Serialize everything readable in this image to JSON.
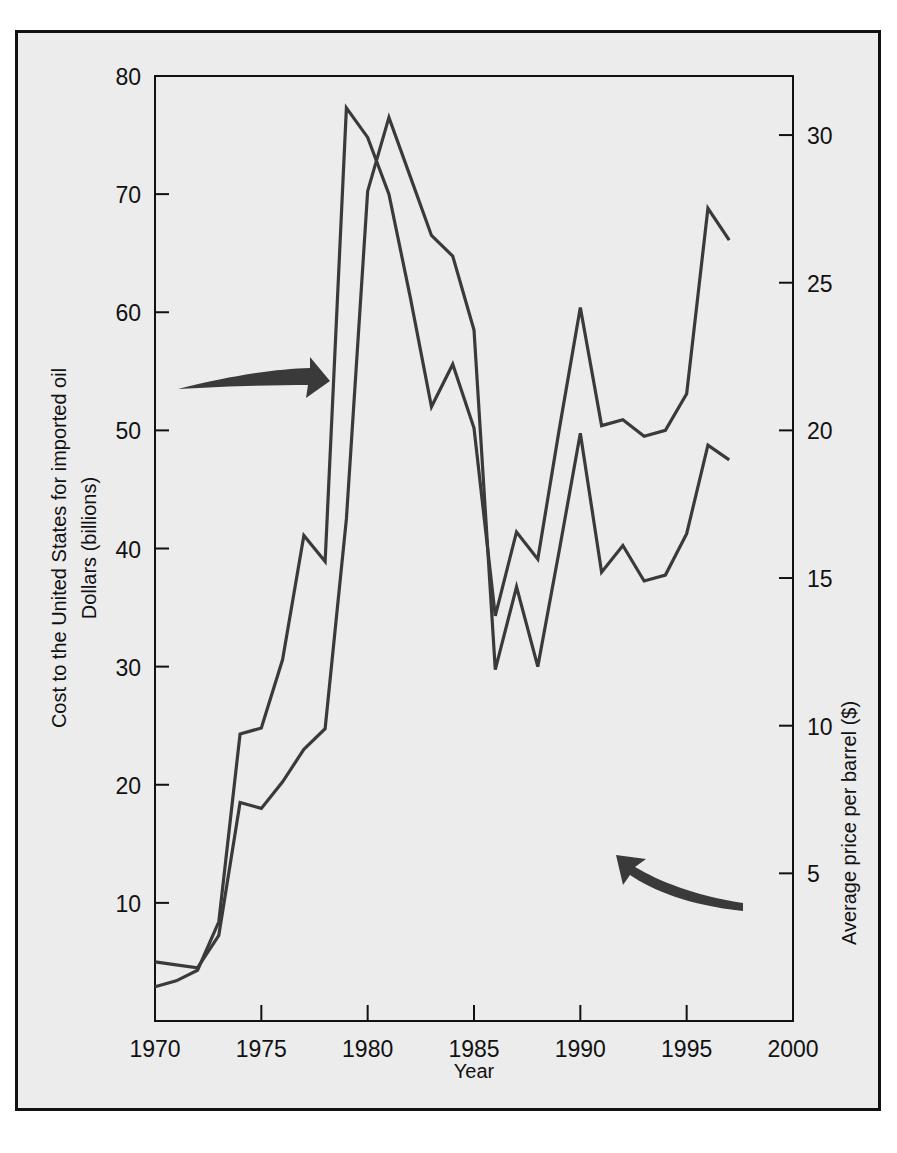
{
  "figure": {
    "background_color": "#ececed",
    "border_color": "#111111",
    "line_color": "#3a3a3a",
    "axis_color": "#111111"
  },
  "chart_data": {
    "type": "line",
    "title": "",
    "xlabel": "Year",
    "ylabel": "Cost to the United States for imported oil Dollars (billions)",
    "y2label": "Average price per barrel ($)",
    "grid": false,
    "legend": "none",
    "xlim": [
      1970,
      2000
    ],
    "xticks": [
      1970,
      1975,
      1980,
      1985,
      1990,
      1995,
      2000
    ],
    "xtick_labels": [
      "1970",
      "1975",
      "1980",
      "1985",
      "1990",
      "1995",
      "2000"
    ],
    "ylim": [
      0,
      80
    ],
    "yticks": [
      10,
      20,
      30,
      40,
      50,
      60,
      70,
      80
    ],
    "ytick_labels": [
      "10",
      "20",
      "30",
      "40",
      "50",
      "60",
      "70",
      "80"
    ],
    "y2lim": [
      0,
      32
    ],
    "y2ticks": [
      5,
      10,
      15,
      20,
      25,
      30
    ],
    "y2tick_labels": [
      "5",
      "10",
      "15",
      "20",
      "25",
      "30"
    ],
    "x": [
      1970,
      1971,
      1972,
      1973,
      1974,
      1975,
      1976,
      1977,
      1978,
      1979,
      1980,
      1981,
      1982,
      1983,
      1984,
      1985,
      1986,
      1987,
      1988,
      1989,
      1990,
      1991,
      1992,
      1993,
      1994,
      1995,
      1996,
      1997
    ],
    "series": [
      {
        "name": "Cost to the United States for imported oil (billions of dollars)",
        "axis": "left",
        "values": [
          2.9,
          3.4,
          4.3,
          8.4,
          24.3,
          24.8,
          30.6,
          41.1,
          38.9,
          77.3,
          74.8,
          70.0,
          61.3,
          52.0,
          55.6,
          50.2,
          34.3,
          41.4,
          39.1,
          50.0,
          60.4,
          50.4,
          50.9,
          49.5,
          50.0,
          53.1,
          68.8,
          66.1
        ]
      },
      {
        "name": "Average price per barrel ($)",
        "axis": "right",
        "values": [
          2.0,
          1.9,
          1.8,
          2.9,
          7.4,
          7.2,
          8.1,
          9.2,
          9.9,
          17.0,
          28.1,
          30.6,
          28.6,
          26.6,
          25.9,
          23.4,
          11.9,
          14.7,
          12.0,
          15.9,
          19.9,
          15.2,
          16.1,
          14.9,
          15.1,
          16.5,
          19.5,
          19.0
        ]
      }
    ],
    "annotations": [
      {
        "name": "arrow-to-cost-curve",
        "label": "",
        "points_to": "cost-curve",
        "direction": "right"
      },
      {
        "name": "arrow-to-price-curve",
        "label": "",
        "points_to": "price-curve",
        "direction": "left"
      }
    ]
  }
}
